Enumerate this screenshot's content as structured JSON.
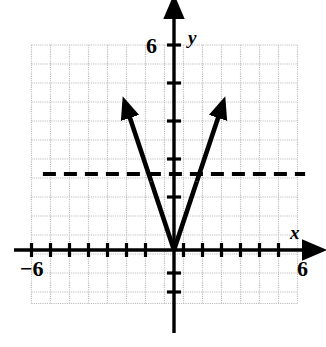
{
  "figure": {
    "type": "coordinate-grid-graph",
    "background_color": "#ffffff",
    "ink_color": "#000000",
    "grid_color": "#b9b9b9"
  },
  "labels": {
    "y_axis": "y",
    "x_axis": "x",
    "y_tick_positive": "6",
    "x_tick_positive": "6",
    "x_tick_negative": "−6"
  },
  "chart_data": {
    "type": "line",
    "title": "",
    "subtitle": "",
    "xlabel": "x",
    "ylabel": "y",
    "xlim": [
      -6.5,
      6.5
    ],
    "ylim": [
      -2.8,
      7.3
    ],
    "xticks": [
      -6,
      -5,
      -4,
      -3,
      -2,
      -1,
      0,
      1,
      2,
      3,
      4,
      5,
      6
    ],
    "yticks": [
      -2,
      -1,
      0,
      1,
      2,
      3,
      4,
      5,
      6
    ],
    "xtick_labels_shown": [
      "−6",
      "6"
    ],
    "ytick_labels_shown": [
      "6"
    ],
    "grid": true,
    "grid_spacing": 1,
    "grid_x_range": [
      -6.5,
      6.5
    ],
    "grid_y_range": [
      -2.8,
      6.6
    ],
    "legend": "none",
    "axes_arrows": [
      "x-positive",
      "y-positive"
    ],
    "series": [
      {
        "name": "absolute-value-function",
        "equation": "y = 3|x|",
        "style": "solid",
        "linewidth": 4,
        "color": "#000000",
        "arrows": [
          "start",
          "end"
        ],
        "vertex": [
          0,
          0
        ],
        "slope_left": -3,
        "slope_right": 3,
        "points": [
          [
            -2.4,
            7.2
          ],
          [
            0,
            0
          ],
          [
            2.4,
            7.2
          ]
        ]
      },
      {
        "name": "horizontal-dashed-line",
        "equation": "y = 4",
        "style": "dashed",
        "linewidth": 4,
        "color": "#000000",
        "dash_pattern": [
          13,
          8
        ],
        "x_range": [
          -6.9,
          6.9
        ],
        "y_value": 4
      }
    ],
    "intersections": [
      [
        -1.3333,
        4
      ],
      [
        1.3333,
        4
      ]
    ],
    "annotations": []
  }
}
